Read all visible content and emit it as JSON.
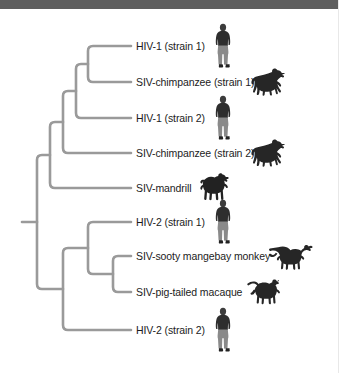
{
  "figure": {
    "type": "phylogenetic-tree",
    "orientation": "left-to-right",
    "line_color": "#9a9a9a",
    "text_color": "#1c1c1c",
    "top_bar_color": "#5e5e5e",
    "background_color": "#ffffff"
  },
  "tips": [
    {
      "id": "hiv1-strain1",
      "label": "HIV-1 (strain 1)",
      "icon": "human-silhouette-icon",
      "y": 46,
      "label_x": 136,
      "icon_x": 210,
      "icon_w": 26,
      "icon_h": 46
    },
    {
      "id": "siv-chimp-strain1",
      "label": "SIV-chimpanzee (strain 1)",
      "icon": "chimpanzee-silhouette-icon",
      "y": 82,
      "label_x": 136,
      "icon_x": 248,
      "icon_w": 42,
      "icon_h": 32
    },
    {
      "id": "hiv1-strain2",
      "label": "HIV-1 (strain 2)",
      "icon": "human-silhouette-icon",
      "y": 118,
      "label_x": 136,
      "icon_x": 210,
      "icon_w": 26,
      "icon_h": 46
    },
    {
      "id": "siv-chimp-strain2",
      "label": "SIV-chimpanzee (strain 2)",
      "icon": "chimpanzee-silhouette-icon",
      "y": 153,
      "label_x": 136,
      "icon_x": 248,
      "icon_w": 42,
      "icon_h": 32
    },
    {
      "id": "siv-mandrill",
      "label": "SIV-mandrill",
      "icon": "mandrill-silhouette-icon",
      "y": 188,
      "label_x": 136,
      "icon_x": 196,
      "icon_w": 38,
      "icon_h": 32
    },
    {
      "id": "hiv2-strain1",
      "label": "HIV-2 (strain 1)",
      "icon": "human-silhouette-icon",
      "y": 222,
      "label_x": 136,
      "icon_x": 210,
      "icon_w": 26,
      "icon_h": 46
    },
    {
      "id": "siv-sooty-mangabey",
      "label": "SIV-sooty mangebay monkey",
      "icon": "mangabey-monkey-silhouette-icon",
      "y": 256,
      "label_x": 136,
      "icon_x": 268,
      "icon_w": 52,
      "icon_h": 34
    },
    {
      "id": "siv-pig-tailed-macaque",
      "label": "SIV-pig-tailed macaque",
      "icon": "macaque-silhouette-icon",
      "y": 292,
      "label_x": 136,
      "icon_x": 245,
      "icon_w": 40,
      "icon_h": 32
    },
    {
      "id": "hiv2-strain2",
      "label": "HIV-2 (strain 2)",
      "icon": "human-silhouette-icon",
      "y": 330,
      "label_x": 136,
      "icon_x": 210,
      "icon_w": 26,
      "icon_h": 46
    }
  ],
  "branches": {
    "tip_line_end_x": 131,
    "node_x": {
      "root": 37,
      "hiv1_clade_outer": 50,
      "chimp_hiv1_group": 63,
      "chimp_hiv1_inner": 76,
      "hiv1_strain1_pair": 88,
      "hiv2_clade": 63,
      "mangabey_macaque_outer": 88,
      "mangabey_macaque_inner": 113
    },
    "root_stem_start_x": 22,
    "root_y": 222
  }
}
